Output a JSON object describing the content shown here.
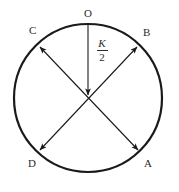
{
  "figure": {
    "type": "geometry-diagram",
    "background_color": "#ffffff",
    "stroke_color": "#1a1a1a",
    "text_color": "#2b2b2b",
    "circle": {
      "center_x": 88,
      "center_y": 98,
      "radius": 74,
      "stroke_width": 2.2
    },
    "labels": {
      "top": "O",
      "upper_left": "C",
      "upper_right": "B",
      "lower_left": "D",
      "lower_right": "A"
    },
    "radius_annotation": {
      "numerator": "K",
      "denominator": "2",
      "full_text": "K/2"
    },
    "segments": [
      {
        "name": "vertical-radius",
        "from": "O",
        "to": "center",
        "x1": 88,
        "y1": 24,
        "x2": 88,
        "y2": 96,
        "arrow_start": false,
        "arrow_end": true
      },
      {
        "name": "diameter-C-A",
        "from": "C",
        "to": "A",
        "x1": 39,
        "y1": 46,
        "x2": 139,
        "y2": 151,
        "arrow_start": true,
        "arrow_end": true
      },
      {
        "name": "diameter-B-D",
        "from": "B",
        "to": "D",
        "x1": 138,
        "y1": 46,
        "x2": 39,
        "y2": 151,
        "arrow_start": true,
        "arrow_end": true
      }
    ]
  }
}
